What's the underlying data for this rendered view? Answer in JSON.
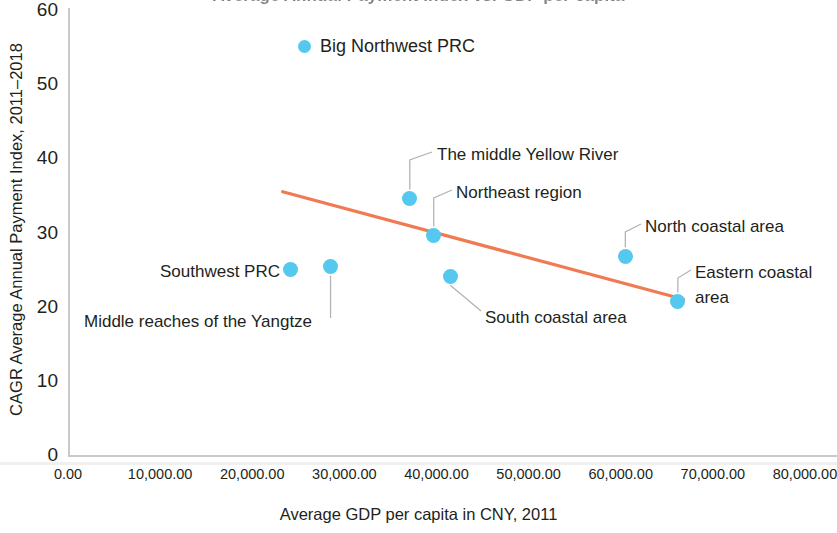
{
  "chart_data": {
    "type": "scatter",
    "title": "Average Annual Payment Index vs. GDP per capita",
    "xlabel": "Average GDP per capita in CNY, 2011",
    "ylabel": "CAGR Average Annual Payment Index, 2011–2018",
    "xlim": [
      0,
      80000
    ],
    "ylim": [
      0,
      60
    ],
    "grid": false,
    "legend_position": "top-center",
    "series": [
      {
        "name": "Big Northwest PRC",
        "color": "#54c8ee",
        "points": [
          {
            "label": "Southwest PRC",
            "x": 24200,
            "y": 25.0
          },
          {
            "label": "Middle reaches of the Yangtze",
            "x": 28500,
            "y": 25.4
          },
          {
            "label": "The middle Yellow River",
            "x": 37100,
            "y": 34.6
          },
          {
            "label": "Northeast region",
            "x": 39700,
            "y": 29.6
          },
          {
            "label": "South coastal area",
            "x": 41500,
            "y": 24.1
          },
          {
            "label": "North coastal area",
            "x": 60500,
            "y": 26.8
          },
          {
            "label": "Eastern coastal area",
            "x": 66200,
            "y": 20.7
          }
        ]
      }
    ],
    "trendline": {
      "color": "#f07a52",
      "x_start": 23300,
      "y_start": 35.5,
      "x_end": 66800,
      "y_end": 21.0
    },
    "xticks": [
      "0.00",
      "10,000.00",
      "20,000.00",
      "30,000.00",
      "40,000.00",
      "50,000.00",
      "60,000.00",
      "70,000.00",
      "80,000.00"
    ],
    "xtick_values": [
      0,
      10000,
      20000,
      30000,
      40000,
      50000,
      60000,
      70000,
      80000
    ],
    "yticks": [
      "0",
      "10",
      "20",
      "30",
      "40",
      "50",
      "60"
    ],
    "ytick_values": [
      0,
      10,
      20,
      30,
      40,
      50,
      60
    ]
  },
  "legend": {
    "items": [
      {
        "label": "Big Northwest PRC",
        "color": "#54c8ee"
      }
    ]
  },
  "annotations": [
    {
      "name": "the-middle-yellow-river",
      "text": "The middle Yellow River"
    },
    {
      "name": "northeast-region",
      "text": "Northeast region"
    },
    {
      "name": "north-coastal-area",
      "text": "North coastal area"
    },
    {
      "name": "eastern-coastal-area",
      "text": "Eastern coastal\narea"
    },
    {
      "name": "south-coastal-area",
      "text": "South coastal area"
    },
    {
      "name": "southwest-prc",
      "text": "Southwest PRC"
    },
    {
      "name": "middle-reaches-of-the-yangtze",
      "text": "Middle reaches of the Yangtze"
    }
  ],
  "colors": {
    "marker": "#54c8ee",
    "trendline": "#f07a52",
    "axis": "#c9c9c9",
    "text": "#231f20"
  }
}
